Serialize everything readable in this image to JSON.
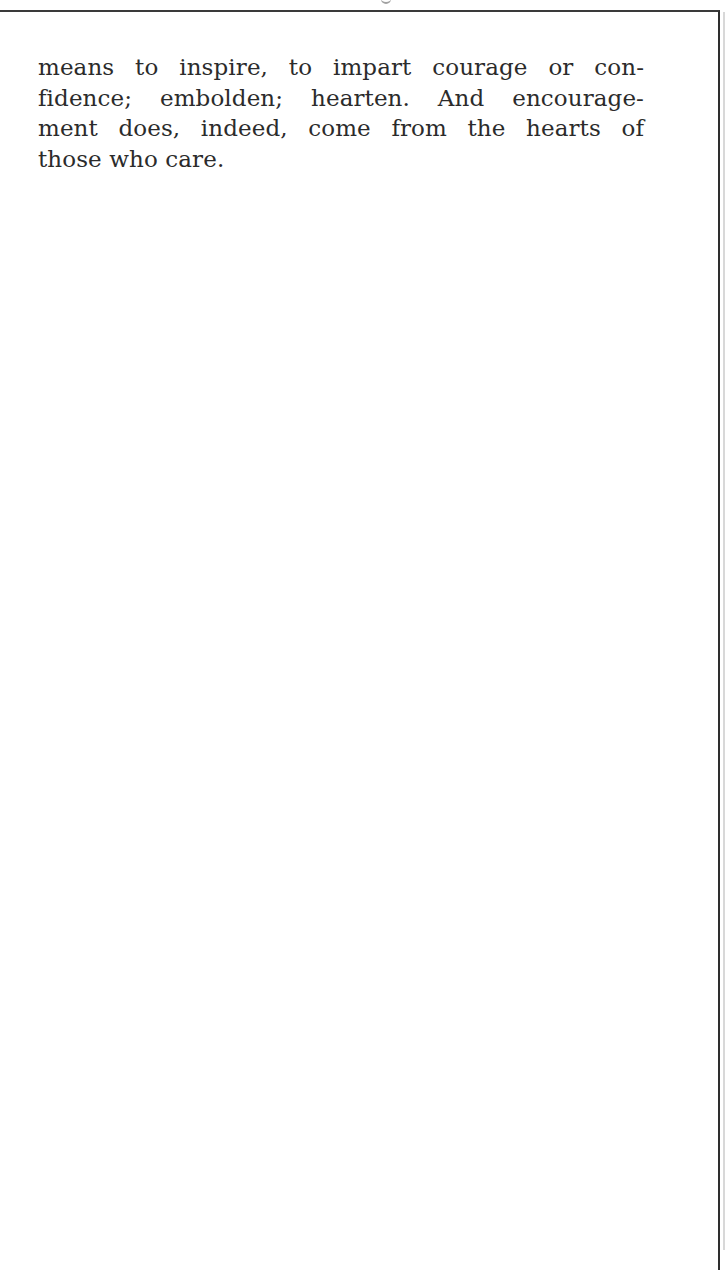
{
  "page": {
    "border_color": "#2e2e2e",
    "text_color": "#2b2b2b",
    "background": "#ffffff"
  },
  "paragraph": {
    "lines": [
      "means to inspire, to impart courage or con-",
      "fidence; embolden; hearten. And encourage-",
      "ment does, indeed, come from the hearts of",
      "those who care."
    ]
  }
}
